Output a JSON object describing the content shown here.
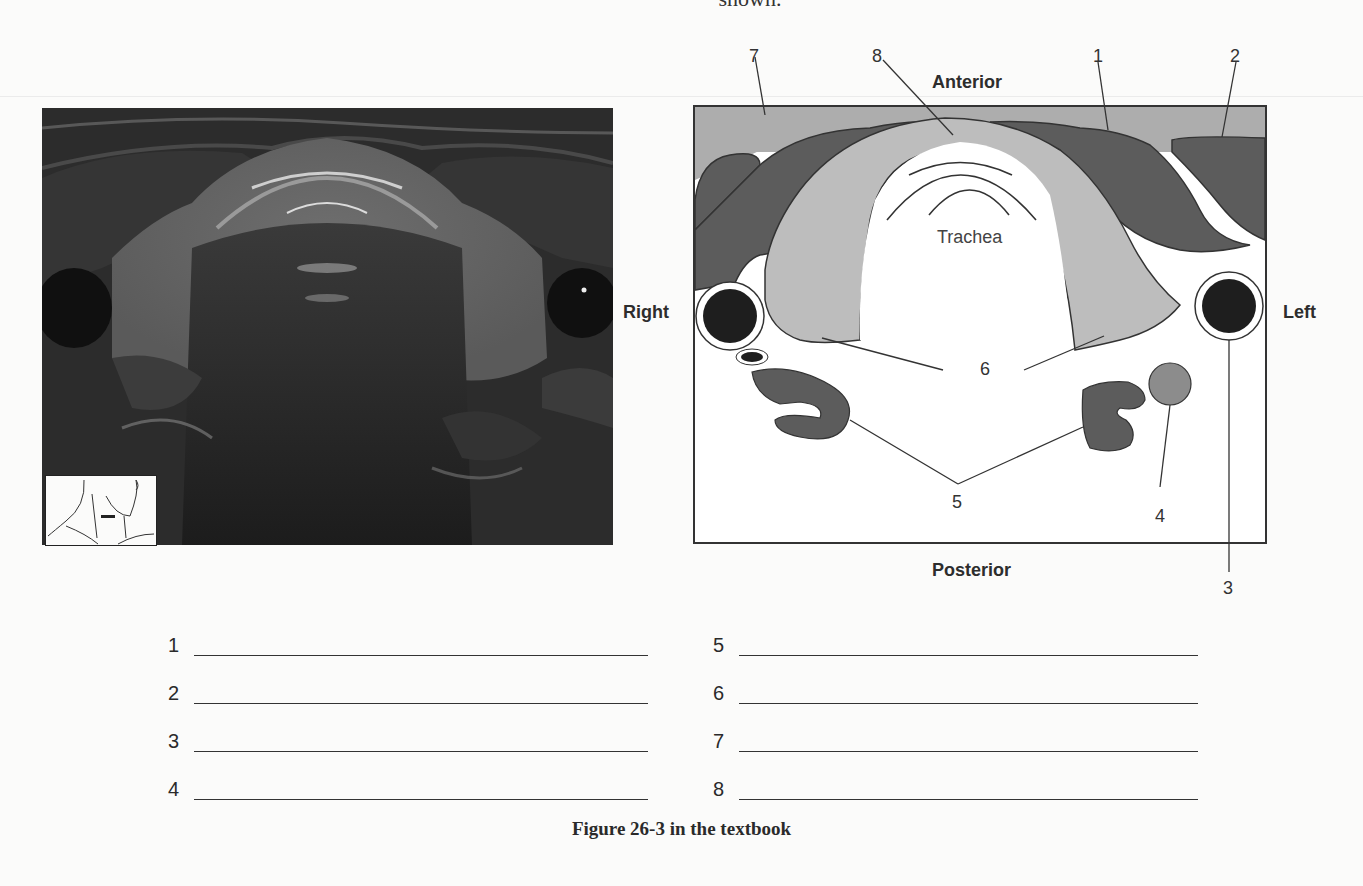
{
  "page": {
    "top_text_fragment": "shown.",
    "caption": "Figure 26-3 in the textbook"
  },
  "ultrasound": {
    "description": "Transverse ultrasound image of the thyroid gland",
    "inset_icon": "neck-transducer-position-icon"
  },
  "diagram": {
    "orientation": {
      "anterior": "Anterior",
      "posterior": "Posterior",
      "right": "Right",
      "left": "Left"
    },
    "center_label": "Trachea",
    "callouts": [
      "1",
      "2",
      "3",
      "4",
      "5",
      "6",
      "7",
      "8"
    ],
    "colors": {
      "muscle_dark": "#595959",
      "thyroid_light": "#bdbdbd",
      "subcutaneous": "#a9a9a9",
      "vessel": "#1f1f1f",
      "nodule": "#8c8c8c",
      "outline": "#333333"
    }
  },
  "answers": {
    "left_column": [
      {
        "number": "1",
        "value": ""
      },
      {
        "number": "2",
        "value": ""
      },
      {
        "number": "3",
        "value": ""
      },
      {
        "number": "4",
        "value": ""
      }
    ],
    "right_column": [
      {
        "number": "5",
        "value": ""
      },
      {
        "number": "6",
        "value": ""
      },
      {
        "number": "7",
        "value": ""
      },
      {
        "number": "8",
        "value": ""
      }
    ]
  }
}
